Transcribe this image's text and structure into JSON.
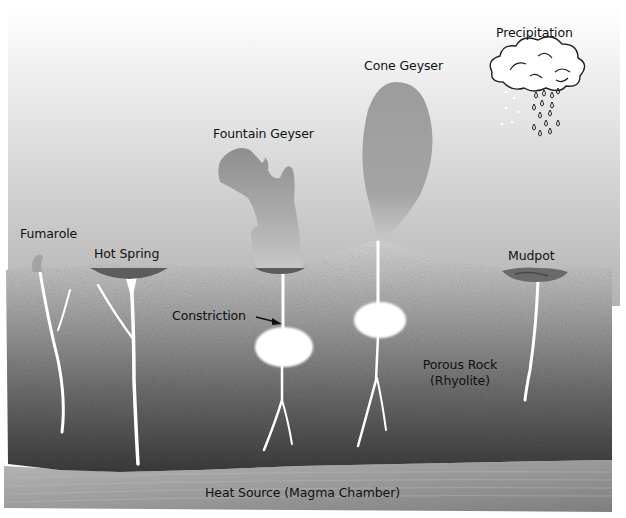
{
  "diagram": {
    "colors": {
      "sky_top": "#ffffff",
      "sky_bottom": "#b4b4b4",
      "rock_top": "#d6d6d6",
      "rock_bottom": "#3e3e3e",
      "magma": "#9a9a9a",
      "conduit": "#ffffff",
      "pool": "#5a5a5a",
      "steam": "#8c8c8c"
    },
    "labels": {
      "precipitation": "Precipitation",
      "cone_geyser": "Cone Geyser",
      "fountain_geyser": "Fountain Geyser",
      "fumarole": "Fumarole",
      "hot_spring": "Hot Spring",
      "mudpot": "Mudpot",
      "constriction": "Constriction",
      "porous_rock_line1": "Porous Rock",
      "porous_rock_line2": "(Rhyolite)",
      "heat_source": "Heat Source (Magma Chamber)"
    },
    "layers": [
      {
        "name": "Sky / atmosphere",
        "region": "top"
      },
      {
        "name": "Porous Rock (Rhyolite)",
        "region": "middle"
      },
      {
        "name": "Heat Source (Magma Chamber)",
        "region": "bottom"
      }
    ],
    "features": [
      {
        "name": "Fumarole",
        "x": 40
      },
      {
        "name": "Hot Spring",
        "x": 130
      },
      {
        "name": "Fountain Geyser",
        "x": 283
      },
      {
        "name": "Cone Geyser",
        "x": 378
      },
      {
        "name": "Mudpot",
        "x": 535
      }
    ]
  }
}
